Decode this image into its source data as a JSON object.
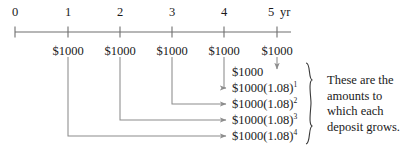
{
  "diagram": {
    "type": "financial-timeline",
    "axis": {
      "unit_label": "yr",
      "ticks": [
        {
          "label": "0",
          "year": 0,
          "x": 15
        },
        {
          "label": "1",
          "year": 1,
          "x": 68
        },
        {
          "label": "2",
          "year": 2,
          "x": 120
        },
        {
          "label": "3",
          "year": 3,
          "x": 172
        },
        {
          "label": "4",
          "year": 4,
          "x": 224
        },
        {
          "label": "5",
          "year": 5,
          "x": 277
        }
      ],
      "line_color": "#6e6e6e",
      "start_x": 15,
      "end_x": 291,
      "y": 32
    },
    "deposits": [
      {
        "label": "$1000",
        "year": 1,
        "x": 68
      },
      {
        "label": "$1000",
        "year": 2,
        "x": 120
      },
      {
        "label": "$1000",
        "year": 3,
        "x": 172
      },
      {
        "label": "$1000",
        "year": 4,
        "x": 224
      },
      {
        "label": "$1000",
        "year": 5,
        "x": 277
      }
    ],
    "results": [
      {
        "base": "$1000",
        "factor": "",
        "exponent": "",
        "from_year": 5,
        "y": 72
      },
      {
        "base": "$1000",
        "factor": "(1.08)",
        "exponent": "1",
        "from_year": 4,
        "y": 88
      },
      {
        "base": "$1000",
        "factor": "(1.08)",
        "exponent": "2",
        "from_year": 3,
        "y": 104
      },
      {
        "base": "$1000",
        "factor": "(1.08)",
        "exponent": "3",
        "from_year": 2,
        "y": 120
      },
      {
        "base": "$1000",
        "factor": "(1.08)",
        "exponent": "4",
        "from_year": 1,
        "y": 136
      }
    ],
    "note_lines": [
      "These are the",
      "amounts to",
      "which each",
      "deposit grows."
    ],
    "colors": {
      "text": "#1a1a1a",
      "axis": "#6e6e6e",
      "connector": "#8c8c8c",
      "brace": "#3a3a3a",
      "background": "#ffffff"
    }
  }
}
